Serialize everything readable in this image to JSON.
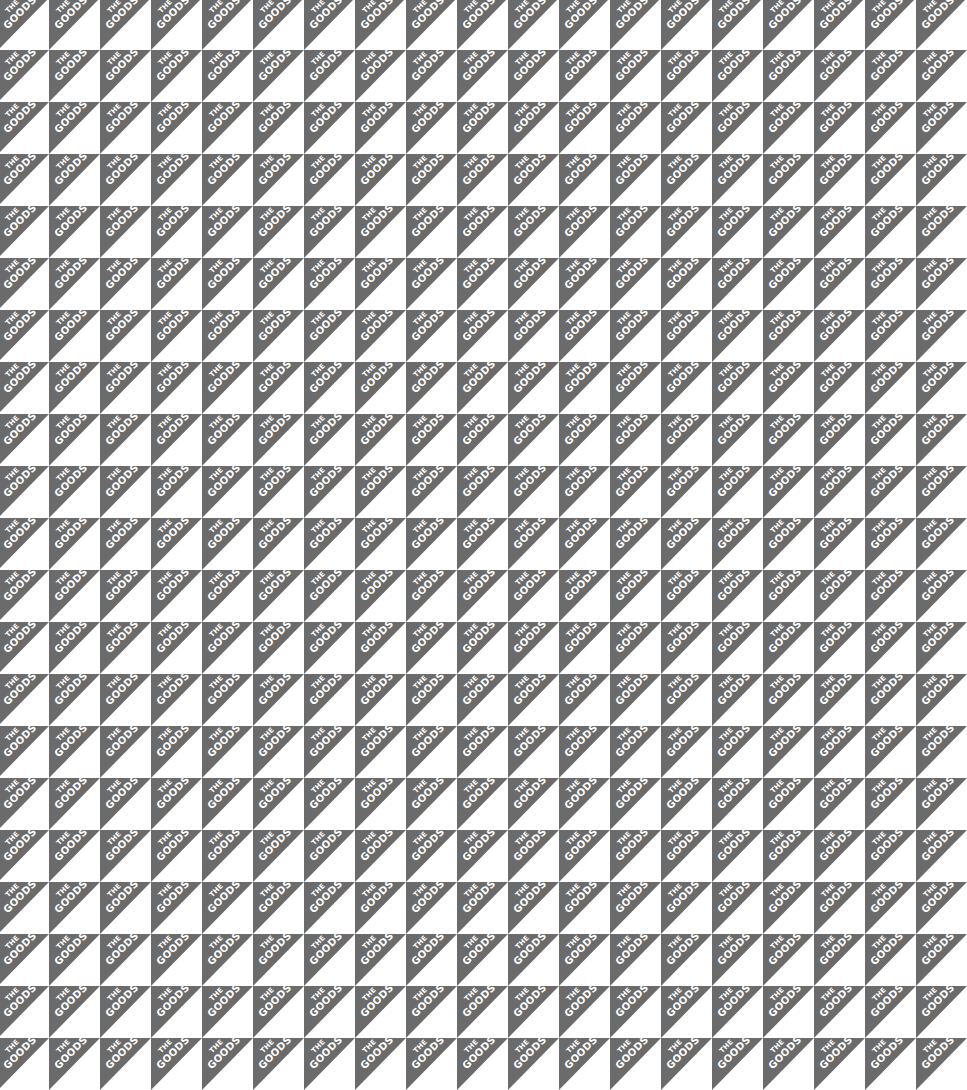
{
  "pattern": {
    "brand_line1": "THE",
    "brand_line2": "GOODS",
    "columns": 19,
    "rows": 21,
    "tile_px": [
      51,
      52
    ],
    "colors": {
      "triangle": "#6b6b6b",
      "background": "#ffffff",
      "text": "#ffffff"
    }
  }
}
